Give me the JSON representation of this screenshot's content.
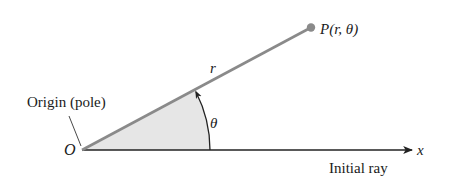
{
  "diagram": {
    "labels": {
      "point": "P(r, θ)",
      "radius": "r",
      "angle": "θ",
      "origin_letter": "O",
      "origin_label": "Origin (pole)",
      "axis": "x",
      "initial_ray": "Initial ray"
    },
    "colors": {
      "ray": "#8a8a8a",
      "point": "#8a8a8a",
      "wedge_fill": "#e6e6e6",
      "axis": "#222222",
      "text": "#1a1a1a"
    }
  }
}
